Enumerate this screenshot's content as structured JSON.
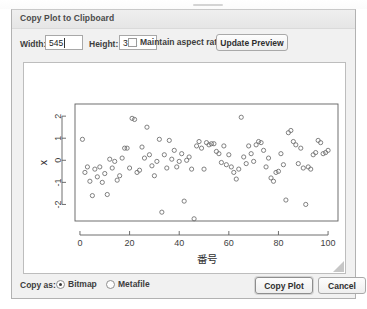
{
  "window": {
    "title": "Copy Plot to Clipboard"
  },
  "toolbar": {
    "width_label": "Width:",
    "width_value": "545",
    "height_label": "Height:",
    "height_value": "372",
    "maintain_aspect_label": "Maintain aspect ratio",
    "maintain_aspect_checked": false,
    "update_preview_label": "Update Preview"
  },
  "footer": {
    "copy_as_label": "Copy as:",
    "bitmap_label": "Bitmap",
    "bitmap_selected": true,
    "metafile_label": "Metafile",
    "metafile_selected": false,
    "copy_plot_label": "Copy Plot",
    "cancel_label": "Cancel"
  },
  "chart_data": {
    "type": "scatter",
    "title": "",
    "xlabel": "番号",
    "ylabel": "x",
    "xlim": [
      -2,
      104
    ],
    "ylim": [
      -2.75,
      2.55
    ],
    "xticks": [
      0,
      20,
      40,
      60,
      80,
      100
    ],
    "yticks": [
      2,
      1,
      0,
      -1,
      -2
    ],
    "grid": false,
    "legend": null,
    "marker": "open-circle",
    "marker_color": "#6b6b6b",
    "x": [
      1,
      2,
      3,
      4,
      5,
      6,
      7,
      8,
      9,
      10,
      11,
      12,
      13,
      14,
      15,
      16,
      17,
      18,
      19,
      20,
      21,
      22,
      23,
      24,
      25,
      26,
      27,
      28,
      29,
      30,
      31,
      32,
      33,
      34,
      35,
      36,
      37,
      38,
      39,
      40,
      41,
      42,
      43,
      44,
      45,
      46,
      47,
      48,
      49,
      50,
      51,
      52,
      53,
      54,
      55,
      56,
      57,
      58,
      59,
      60,
      61,
      62,
      63,
      64,
      65,
      66,
      67,
      68,
      69,
      70,
      71,
      72,
      73,
      74,
      75,
      76,
      77,
      78,
      79,
      80,
      81,
      82,
      83,
      84,
      85,
      86,
      87,
      88,
      89,
      90,
      91,
      92,
      93,
      94,
      95,
      96,
      97,
      98,
      99,
      100
    ],
    "y": [
      0.95,
      -0.55,
      -0.3,
      -0.95,
      -1.6,
      -0.4,
      -0.75,
      -0.3,
      -1.0,
      -0.6,
      -1.55,
      0.05,
      -0.35,
      -0.05,
      -0.9,
      -0.7,
      0.1,
      0.55,
      0.55,
      -0.35,
      1.9,
      1.85,
      -0.55,
      -0.45,
      0.6,
      0.1,
      1.5,
      0.25,
      -0.25,
      -0.7,
      -0.05,
      0.95,
      -2.35,
      0.25,
      -0.35,
      0.9,
      0.05,
      0.45,
      -0.3,
      -0.05,
      0.3,
      -1.85,
      0.0,
      0.15,
      -0.4,
      -2.65,
      0.65,
      0.85,
      0.55,
      -0.4,
      0.8,
      0.7,
      0.75,
      0.75,
      0.4,
      0.3,
      -0.1,
      0.65,
      -0.2,
      0.25,
      -0.3,
      -0.55,
      -0.85,
      -0.4,
      1.95,
      0.15,
      -0.15,
      0.65,
      0.3,
      -0.05,
      0.7,
      0.85,
      0.8,
      0.45,
      -0.3,
      0.1,
      -0.8,
      -0.95,
      -0.55,
      -0.5,
      0.3,
      -0.2,
      -1.8,
      1.25,
      1.35,
      0.85,
      0.7,
      -0.15,
      0.55,
      -0.35,
      -2.0,
      -0.3,
      -0.4,
      0.25,
      0.35,
      0.9,
      0.8,
      0.3,
      0.35,
      0.45
    ]
  }
}
